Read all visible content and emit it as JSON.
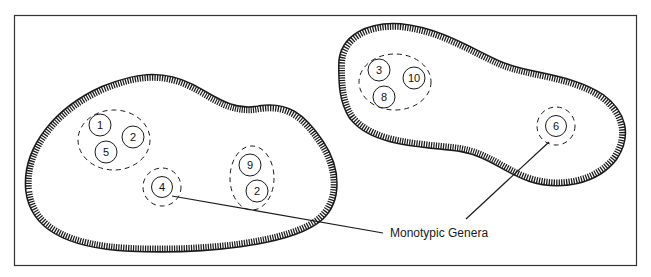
{
  "diagram": {
    "callout_label": "Monotypic Genera",
    "frame": {
      "x": 14,
      "y": 15,
      "width": 623,
      "height": 251
    },
    "colors": {
      "ink": "#1a1a1a",
      "background": "#ffffff"
    },
    "islands": [
      {
        "name": "left-island",
        "groups": [
          {
            "name": "group-1-5-2",
            "members": [
              "1",
              "5",
              "2"
            ]
          },
          {
            "name": "group-4",
            "members": [
              "4"
            ],
            "monotypic": true
          },
          {
            "name": "group-9-2",
            "members": [
              "9",
              "2"
            ]
          }
        ]
      },
      {
        "name": "right-island",
        "groups": [
          {
            "name": "group-3-10-8",
            "members": [
              "3",
              "10",
              "8"
            ]
          },
          {
            "name": "group-6",
            "members": [
              "6"
            ],
            "monotypic": true
          }
        ]
      }
    ]
  }
}
